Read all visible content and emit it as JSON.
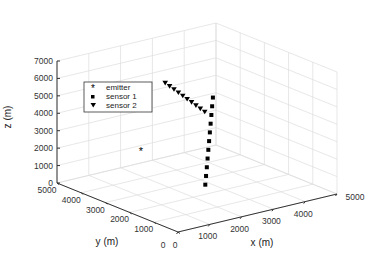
{
  "chart_data": {
    "type": "scatter3d",
    "title": "",
    "xlabel": "x (m)",
    "ylabel": "y (m)",
    "zlabel": "z (m)",
    "xlim": [
      0,
      5000
    ],
    "ylim": [
      0,
      5000
    ],
    "zlim": [
      0,
      7000
    ],
    "xticks": [
      "0",
      "1000",
      "2000",
      "3000",
      "4000",
      "5000"
    ],
    "yticks": [
      "0",
      "1000",
      "2000",
      "3000",
      "4000",
      "5000"
    ],
    "zticks": [
      "0",
      "1000",
      "2000",
      "3000",
      "4000",
      "5000",
      "6000",
      "7000"
    ],
    "grid": true,
    "legend_position": "upper-left",
    "series": [
      {
        "name": "emitter",
        "marker": "asterisk",
        "color": "#000000",
        "points": [
          [
            1500,
            3500,
            2000
          ]
        ]
      },
      {
        "name": "sensor 1",
        "marker": "square",
        "color": "#000000",
        "points": [
          [
            2000,
            1500,
            1000
          ],
          [
            2100,
            1600,
            1400
          ],
          [
            2200,
            1700,
            1800
          ],
          [
            2300,
            1800,
            2200
          ],
          [
            2400,
            1900,
            2600
          ],
          [
            2500,
            2000,
            3000
          ],
          [
            2600,
            2100,
            3400
          ],
          [
            2700,
            2200,
            3800
          ],
          [
            2800,
            2300,
            4200
          ],
          [
            2900,
            2400,
            4600
          ],
          [
            3000,
            2500,
            5000
          ]
        ]
      },
      {
        "name": "sensor 2",
        "marker": "triangle-down",
        "color": "#000000",
        "points": [
          [
            1500,
            2500,
            6500
          ],
          [
            1600,
            2450,
            6300
          ],
          [
            1700,
            2400,
            6100
          ],
          [
            1800,
            2350,
            5900
          ],
          [
            1900,
            2300,
            5700
          ],
          [
            2000,
            2250,
            5500
          ],
          [
            2100,
            2200,
            5300
          ],
          [
            2200,
            2150,
            5100
          ],
          [
            2300,
            2100,
            4900
          ],
          [
            2400,
            2050,
            4700
          ]
        ]
      }
    ]
  },
  "legend": {
    "items": [
      {
        "label": "emitter"
      },
      {
        "label": "sensor 1"
      },
      {
        "label": "sensor 2"
      }
    ]
  }
}
